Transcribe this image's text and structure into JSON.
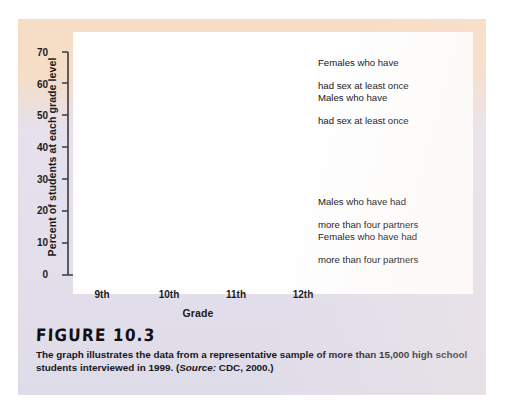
{
  "figure": {
    "title": "FIGURE 10.3",
    "caption_part1": "The graph illustrates the data from a representative sample of more than 15,000 high school students interviewed in 1999. (",
    "caption_source_label": "Source:",
    "caption_part2": " CDC, 2000.)"
  },
  "chart_data": {
    "type": "line",
    "title": "",
    "xlabel": "Grade",
    "ylabel": "Percent of students at each grade level",
    "categories": [
      "9th",
      "10th",
      "11th",
      "12th"
    ],
    "xtick_labels": [
      "9th",
      "10th",
      "11th",
      "12th"
    ],
    "ytick_labels": [
      "0",
      "10",
      "20",
      "30",
      "40",
      "50",
      "60",
      "70"
    ],
    "yticks": [
      0,
      10,
      20,
      30,
      40,
      50,
      60,
      70
    ],
    "ylim": [
      0,
      73
    ],
    "grid": false,
    "legend_position": "inline-annotations",
    "series": [
      {
        "name": "Females who have had sex at least once",
        "label_line1": "Females who have",
        "label_line2": "had sex at least once",
        "color": "#2e6b52",
        "values": [
          31,
          44,
          49,
          64.5
        ]
      },
      {
        "name": "Males who have had sex at least once",
        "label_line1": "Males who have",
        "label_line2": "had sex at least once",
        "color": "#94286b",
        "values": [
          44,
          48.5,
          49.5,
          63
        ]
      },
      {
        "name": "Males who have had more than four partners",
        "label_line1": "Males who have had",
        "label_line2": "more than four partners",
        "color": "#b munched",
        "values": [
          15,
          19.5,
          19,
          23.5
        ]
      },
      {
        "name": "Females who have had more than four partners",
        "label_line1": "Females who have had",
        "label_line2": "more than four partners",
        "color": "#93c7a2",
        "values": [
          8,
          9.5,
          14.5,
          21.5
        ]
      }
    ]
  },
  "colors": {
    "dark_green": "#2e6b52",
    "dark_magenta": "#94286b",
    "light_purple": "#bd74b2",
    "light_green": "#93c7a2",
    "peach_band": "#f6ddc6",
    "lavender_body": "#e0dcea",
    "axis": "#3a3a40",
    "text": "#15151a"
  },
  "annotations": [
    {
      "key": "females-sex-once",
      "line1": "Females who have",
      "line2": "had sex at least once"
    },
    {
      "key": "males-sex-once",
      "line1": "Males who have",
      "line2": "had sex at least once"
    },
    {
      "key": "males-four",
      "line1": "Males who have had",
      "line2": "more than four partners"
    },
    {
      "key": "females-four",
      "line1": "Females who have had",
      "line2": "more than four partners"
    }
  ]
}
